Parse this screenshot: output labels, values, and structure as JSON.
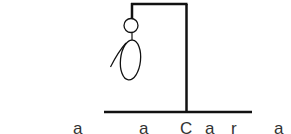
{
  "game": {
    "name": "hangman",
    "stroke_color": "#111111",
    "parts_drawn": [
      "gallows-base",
      "gallows-post",
      "gallows-beam",
      "rope",
      "head",
      "body",
      "left-arm"
    ],
    "revealed_letters": [
      {
        "char": "a",
        "x": 77
      },
      {
        "char": "a",
        "x": 143
      },
      {
        "char": "C",
        "x": 184
      },
      {
        "char": "a",
        "x": 208
      },
      {
        "char": "r",
        "x": 234
      },
      {
        "char": "a",
        "x": 278
      }
    ]
  }
}
